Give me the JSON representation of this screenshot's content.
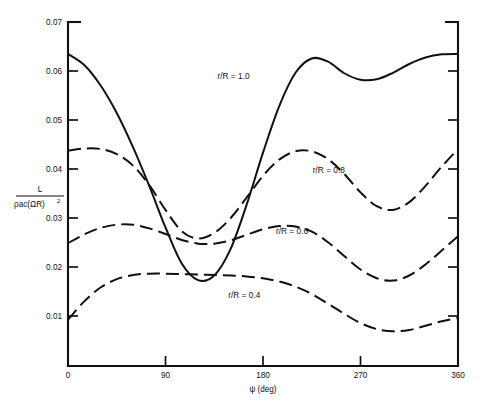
{
  "figure": {
    "name": "blade-lift-vs-azimuth-chart",
    "background_color": "#ffffff",
    "ink_color": "#111111"
  },
  "axes": {
    "x": {
      "title_symbol": "ψ",
      "title_units": "(deg)",
      "title_full": "ψ (deg)",
      "min": 0,
      "max": 360,
      "ticks": [
        0,
        90,
        180,
        270,
        360
      ],
      "tick_labels": [
        "0",
        "90",
        "180",
        "270",
        "360"
      ]
    },
    "y": {
      "label_numerator": "L",
      "label_denominator_rho": "ρ",
      "label_denominator_ac": "ac",
      "label_denominator_paren": "(ΩR)",
      "label_denominator_exp": "2",
      "label_denominator_full": "ρac(ΩR)",
      "label_full": "L / ρac(ΩR)²",
      "min": 0,
      "max": 0.0745,
      "ticks": [
        0.01,
        0.02,
        0.03,
        0.04,
        0.05,
        0.06,
        0.07
      ],
      "tick_labels": [
        "0.01",
        "0.02",
        "0.03",
        "0.04",
        "0.05",
        "0.06",
        "0.07"
      ]
    }
  },
  "chart_data": {
    "type": "line",
    "title": "",
    "subtitle": "",
    "xlabel": "ψ (deg)",
    "ylabel": "L / ρac(ΩR)²",
    "xlim": [
      0,
      360
    ],
    "ylim": [
      0,
      0.0745
    ],
    "grid": false,
    "legend_position": "inline-annotations",
    "x": [
      0,
      15,
      30,
      45,
      60,
      75,
      90,
      105,
      120,
      135,
      150,
      165,
      180,
      195,
      210,
      225,
      240,
      255,
      270,
      285,
      300,
      315,
      330,
      345,
      360
    ],
    "series": [
      {
        "name": "r/R = 1.0",
        "label": "r/R = 1.0",
        "linestyle": "solid",
        "label_x_deg": 138,
        "label_y_value": 0.0622,
        "values": [
          0.0676,
          0.0652,
          0.0608,
          0.0548,
          0.0474,
          0.039,
          0.03,
          0.0222,
          0.0186,
          0.0196,
          0.0253,
          0.035,
          0.0462,
          0.0563,
          0.0635,
          0.0666,
          0.0659,
          0.0634,
          0.062,
          0.0621,
          0.0635,
          0.0654,
          0.0668,
          0.0675,
          0.0676
        ]
      },
      {
        "name": "r/R = 0.8",
        "label": "r/R = 0.8",
        "linestyle": "dashed",
        "label_x_deg": 226,
        "label_y_value": 0.0419,
        "values": [
          0.0466,
          0.0471,
          0.047,
          0.0459,
          0.0434,
          0.0392,
          0.0338,
          0.0292,
          0.0276,
          0.0288,
          0.032,
          0.0365,
          0.0412,
          0.0447,
          0.0465,
          0.0465,
          0.0448,
          0.0416,
          0.0376,
          0.0346,
          0.0338,
          0.0355,
          0.039,
          0.0432,
          0.047
        ]
      },
      {
        "name": "r/R = 0.6",
        "label": "r/R = 0.6",
        "linestyle": "dashed",
        "label_x_deg": 192,
        "label_y_value": 0.0286,
        "values": [
          0.0266,
          0.0285,
          0.0299,
          0.0306,
          0.0306,
          0.0298,
          0.0286,
          0.0273,
          0.0265,
          0.0265,
          0.0272,
          0.0284,
          0.0296,
          0.0303,
          0.0302,
          0.0291,
          0.0268,
          0.0238,
          0.0209,
          0.019,
          0.0185,
          0.0196,
          0.022,
          0.025,
          0.0281
        ]
      },
      {
        "name": "r/R = 0.4",
        "label": "r/R = 0.4",
        "linestyle": "dashed",
        "label_x_deg": 148,
        "label_y_value": 0.0147,
        "values": [
          0.01,
          0.014,
          0.017,
          0.0188,
          0.0197,
          0.02,
          0.02,
          0.0199,
          0.0198,
          0.0197,
          0.0196,
          0.0194,
          0.019,
          0.0183,
          0.0172,
          0.0156,
          0.0135,
          0.0113,
          0.0093,
          0.008,
          0.0075,
          0.0078,
          0.0087,
          0.0097,
          0.0104
        ]
      }
    ]
  }
}
